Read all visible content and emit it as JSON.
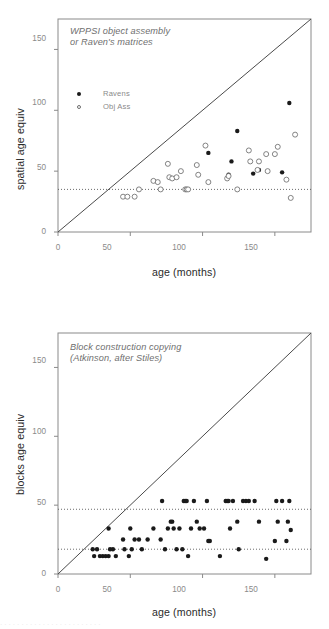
{
  "figure": {
    "xlabel": "age (months)",
    "xticks": [
      0,
      50,
      100,
      150
    ],
    "yticks": [
      0,
      50,
      100,
      150
    ],
    "accent_data_color": "#1a1a1a",
    "frame_color": "#8a8a8a",
    "reference_line_color": "#5a5a5a",
    "identity_line_color": "#4a4a4a",
    "footer_artifact": "· · · · ·  · · · ·  · · ·  · · · · ·  · ·  · · · · ·"
  },
  "chart_data": [
    {
      "type": "scatter",
      "panel": "top",
      "title": "WPPSI object assembly\nor Raven's matrices",
      "xlabel": "age (months)",
      "ylabel": "spatial age equiv",
      "xlim": [
        0,
        175
      ],
      "ylim": [
        0,
        175
      ],
      "xticks": [
        0,
        50,
        100,
        150
      ],
      "yticks": [
        0,
        50,
        100,
        150
      ],
      "grid": false,
      "legend_position": "upper-left-inside",
      "identity_line": {
        "label": "y = x",
        "from": [
          0,
          0
        ],
        "to": [
          175,
          175
        ]
      },
      "reference_lines": [
        {
          "orientation": "horizontal",
          "y": 35,
          "style": "dotted"
        }
      ],
      "series": [
        {
          "name": "Ravens",
          "marker": "filled-circle",
          "color": "#1a1a1a",
          "points": [
            [
              104,
              65
            ],
            [
              118,
              47
            ],
            [
              120,
              58
            ],
            [
              124,
              83
            ],
            [
              135,
              48
            ],
            [
              139,
              51
            ],
            [
              155,
              49
            ],
            [
              160,
              106
            ]
          ]
        },
        {
          "name": "Obj Ass",
          "marker": "open-circle",
          "color": "#6e6e6e",
          "points": [
            [
              45,
              29
            ],
            [
              48,
              29
            ],
            [
              53,
              29
            ],
            [
              56,
              35
            ],
            [
              66,
              42
            ],
            [
              69,
              41
            ],
            [
              71,
              35
            ],
            [
              76,
              56
            ],
            [
              77,
              45
            ],
            [
              79,
              44
            ],
            [
              82,
              45
            ],
            [
              85,
              50
            ],
            [
              88,
              35
            ],
            [
              89,
              35
            ],
            [
              90,
              35
            ],
            [
              96,
              55
            ],
            [
              97,
              47
            ],
            [
              102,
              71
            ],
            [
              104,
              41
            ],
            [
              117,
              44
            ],
            [
              118,
              46
            ],
            [
              124,
              35
            ],
            [
              132,
              67
            ],
            [
              133,
              58
            ],
            [
              138,
              51
            ],
            [
              139,
              58
            ],
            [
              144,
              64
            ],
            [
              145,
              50
            ],
            [
              150,
              64
            ],
            [
              152,
              70
            ],
            [
              158,
              43
            ],
            [
              161,
              28
            ],
            [
              164,
              80
            ]
          ]
        }
      ]
    },
    {
      "type": "scatter",
      "panel": "bottom",
      "title": "Block construction copying\n(Atkinson, after Stiles)",
      "xlabel": "age (months)",
      "ylabel": "blocks age equiv",
      "xlim": [
        0,
        175
      ],
      "ylim": [
        0,
        175
      ],
      "xticks": [
        0,
        50,
        100,
        150
      ],
      "yticks": [
        0,
        50,
        100,
        150
      ],
      "grid": false,
      "legend_position": "none",
      "identity_line": {
        "label": "y = x",
        "from": [
          0,
          0
        ],
        "to": [
          175,
          175
        ]
      },
      "reference_lines": [
        {
          "orientation": "horizontal",
          "y": 47,
          "style": "dotted"
        },
        {
          "orientation": "horizontal",
          "y": 18,
          "style": "dotted"
        }
      ],
      "series": [
        {
          "name": "Blocks",
          "marker": "filled-circle",
          "color": "#1a1a1a",
          "points": [
            [
              24,
              18
            ],
            [
              25,
              13
            ],
            [
              27,
              18
            ],
            [
              29,
              13
            ],
            [
              31,
              13
            ],
            [
              33,
              13
            ],
            [
              35,
              33
            ],
            [
              35,
              13
            ],
            [
              36,
              18
            ],
            [
              38,
              18
            ],
            [
              40,
              13
            ],
            [
              45,
              25
            ],
            [
              46,
              18
            ],
            [
              49,
              13
            ],
            [
              50,
              33
            ],
            [
              51,
              18
            ],
            [
              53,
              25
            ],
            [
              56,
              25
            ],
            [
              58,
              18
            ],
            [
              62,
              25
            ],
            [
              66,
              33
            ],
            [
              71,
              25
            ],
            [
              72,
              53
            ],
            [
              74,
              18
            ],
            [
              76,
              33
            ],
            [
              78,
              38
            ],
            [
              79,
              38
            ],
            [
              80,
              33
            ],
            [
              82,
              18
            ],
            [
              84,
              33
            ],
            [
              86,
              18
            ],
            [
              87,
              53
            ],
            [
              88,
              53
            ],
            [
              89,
              53
            ],
            [
              90,
              13
            ],
            [
              92,
              33
            ],
            [
              94,
              53
            ],
            [
              96,
              38
            ],
            [
              98,
              33
            ],
            [
              101,
              33
            ],
            [
              103,
              53
            ],
            [
              104,
              24
            ],
            [
              105,
              24
            ],
            [
              112,
              13
            ],
            [
              116,
              53
            ],
            [
              117,
              53
            ],
            [
              118,
              53
            ],
            [
              119,
              33
            ],
            [
              121,
              53
            ],
            [
              124,
              38
            ],
            [
              125,
              18
            ],
            [
              128,
              53
            ],
            [
              130,
              53
            ],
            [
              132,
              53
            ],
            [
              136,
              53
            ],
            [
              139,
              38
            ],
            [
              144,
              11
            ],
            [
              150,
              24
            ],
            [
              151,
              53
            ],
            [
              152,
              38
            ],
            [
              155,
              53
            ],
            [
              158,
              24
            ],
            [
              159,
              38
            ],
            [
              160,
              53
            ],
            [
              161,
              32
            ]
          ]
        }
      ]
    }
  ]
}
